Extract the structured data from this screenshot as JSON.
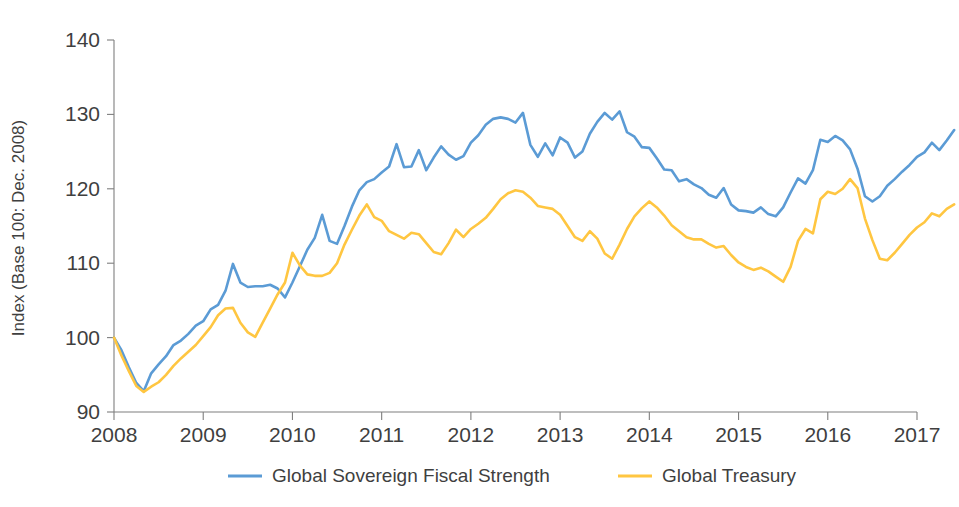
{
  "chart_data": {
    "type": "line",
    "title": "",
    "subtitle": "",
    "xlabel": "",
    "ylabel": "Index (Base 100: Dec. 2008)",
    "xlim": [
      2008,
      2017
    ],
    "ylim": [
      90,
      140
    ],
    "y_ticks": [
      90,
      100,
      110,
      120,
      130,
      140
    ],
    "x_ticks": [
      2008,
      2009,
      2010,
      2011,
      2012,
      2013,
      2014,
      2015,
      2016,
      2017
    ],
    "x_tick_labels": [
      "2008",
      "2009",
      "2010",
      "2011",
      "2012",
      "2013",
      "2014",
      "2015",
      "2016",
      "2017"
    ],
    "y_tick_labels": [
      "90",
      "100",
      "110",
      "120",
      "130",
      "140"
    ],
    "grid": false,
    "legend_position": "bottom",
    "x_step": 0.0833333,
    "x_start": 2008.0,
    "series": [
      {
        "name": "Global Sovereign Fiscal Strength",
        "color": "#5B9BD5",
        "values": [
          100.0,
          98.3,
          96.0,
          93.9,
          92.8,
          95.2,
          96.4,
          97.5,
          99.0,
          99.6,
          100.5,
          101.6,
          102.2,
          103.8,
          104.4,
          106.3,
          109.9,
          107.4,
          106.8,
          106.9,
          106.9,
          107.1,
          106.6,
          105.4,
          107.4,
          109.6,
          111.8,
          113.4,
          116.5,
          113.0,
          112.6,
          115.0,
          117.6,
          119.8,
          120.9,
          121.3,
          122.2,
          123.0,
          126.0,
          122.9,
          123.0,
          125.2,
          122.5,
          124.2,
          125.7,
          124.6,
          123.9,
          124.4,
          126.2,
          127.2,
          128.6,
          129.4,
          129.6,
          129.4,
          128.9,
          130.2,
          125.9,
          124.3,
          126.1,
          124.5,
          126.9,
          126.2,
          124.2,
          125.0,
          127.4,
          129.0,
          130.2,
          129.3,
          130.4,
          127.6,
          127.0,
          125.6,
          125.5,
          124.1,
          122.6,
          122.5,
          121.0,
          121.3,
          120.6,
          120.1,
          119.2,
          118.8,
          120.1,
          117.9,
          117.1,
          117.0,
          116.8,
          117.5,
          116.6,
          116.3,
          117.5,
          119.5,
          121.4,
          120.7,
          122.5,
          126.6,
          126.3,
          127.1,
          126.5,
          125.3,
          122.7,
          119.0,
          118.3,
          119.0,
          120.4,
          121.3,
          122.3,
          123.2,
          124.3,
          124.9,
          126.2,
          125.2,
          126.5,
          127.9
        ]
      },
      {
        "name": "Global Treasury",
        "color": "#FFC641",
        "values": [
          100.0,
          97.6,
          95.5,
          93.5,
          92.7,
          93.4,
          94.0,
          95.0,
          96.2,
          97.2,
          98.1,
          99.0,
          100.2,
          101.4,
          103.0,
          103.9,
          104.0,
          102.0,
          100.7,
          100.1,
          102.0,
          103.9,
          105.8,
          107.4,
          111.4,
          109.7,
          108.5,
          108.3,
          108.3,
          108.7,
          110.0,
          112.5,
          114.5,
          116.4,
          117.9,
          116.2,
          115.7,
          114.3,
          113.8,
          113.3,
          114.1,
          113.9,
          112.7,
          111.5,
          111.2,
          112.7,
          114.5,
          113.5,
          114.6,
          115.3,
          116.1,
          117.3,
          118.6,
          119.4,
          119.8,
          119.6,
          118.8,
          117.7,
          117.5,
          117.3,
          116.5,
          115.0,
          113.5,
          113.0,
          114.3,
          113.3,
          111.3,
          110.6,
          112.5,
          114.6,
          116.3,
          117.4,
          118.3,
          117.5,
          116.4,
          115.1,
          114.3,
          113.5,
          113.2,
          113.2,
          112.6,
          112.1,
          112.3,
          111.1,
          110.1,
          109.5,
          109.1,
          109.4,
          108.9,
          108.2,
          107.5,
          109.5,
          113.0,
          114.6,
          114.0,
          118.6,
          119.6,
          119.3,
          120.0,
          121.3,
          120.1,
          116.0,
          113.1,
          110.6,
          110.4,
          111.4,
          112.6,
          113.8,
          114.8,
          115.5,
          116.7,
          116.3,
          117.3,
          117.9
        ]
      }
    ]
  },
  "legend": {
    "items": [
      {
        "label": "Global Sovereign Fiscal Strength",
        "color": "#5B9BD5"
      },
      {
        "label": "Global Treasury",
        "color": "#FFC641"
      }
    ]
  },
  "axes": {
    "y_title": "Index (Base 100: Dec. 2008)"
  }
}
